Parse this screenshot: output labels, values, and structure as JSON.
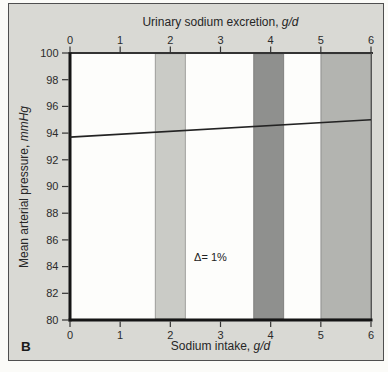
{
  "figure": {
    "panel_label": "B",
    "background": "#d9d9d4",
    "plot_background": "#fdfdfb",
    "border_color": "#4f4f4f",
    "text_color": "#2b2b2b"
  },
  "chart_data": {
    "type": "line",
    "grid": false,
    "legend": null,
    "top_axis": {
      "label_text": "Urinary sodium excretion, ",
      "label_unit": "g/d",
      "ticks": [
        0,
        1,
        2,
        3,
        4,
        5,
        6
      ],
      "range": [
        0,
        6
      ]
    },
    "bottom_axis": {
      "label_text": "Sodium intake, ",
      "label_unit": "g/d",
      "ticks": [
        0,
        1,
        2,
        3,
        4,
        5,
        6
      ],
      "range": [
        0,
        6
      ]
    },
    "left_axis": {
      "label_text": "Mean arterial pressure, ",
      "label_unit": "mmHg",
      "ticks": [
        100,
        98,
        96,
        94,
        92,
        90,
        88,
        86,
        84,
        82,
        80
      ],
      "range": [
        80,
        100
      ]
    },
    "series": [
      {
        "name": "mean-arterial-pressure-trend",
        "x": [
          0,
          6
        ],
        "y": [
          93.7,
          95.0
        ],
        "color": "#232323",
        "width": 1.6
      }
    ],
    "annotation": {
      "text": "Δ= 1%",
      "x": 2.8,
      "y": 84.7
    },
    "bands": [
      {
        "name": "shaded-band-2gd",
        "x_start": 1.7,
        "x_end": 2.3,
        "color": "#cacbc6"
      },
      {
        "name": "shaded-band-4gd",
        "x_start": 3.66,
        "x_end": 4.26,
        "color": "#8f908e"
      },
      {
        "name": "shaded-band-5-6gd",
        "x_start": 5.0,
        "x_end": 6.0,
        "color": "#b3b4b0"
      }
    ]
  }
}
